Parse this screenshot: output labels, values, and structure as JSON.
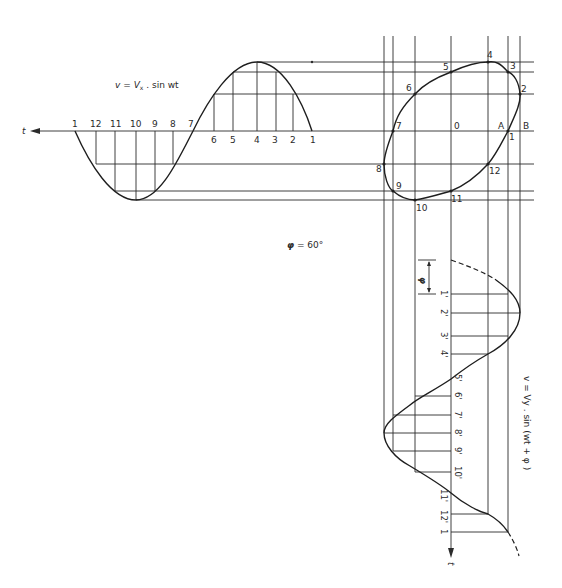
{
  "diagram": {
    "colors": {
      "ink": "#2b2b2b",
      "background": "#ffffff"
    },
    "horizontal_wave": {
      "equation": "v = Vx . sin wt",
      "equation_parts": {
        "v": "v",
        "eq": "=",
        "V": "V",
        "sub": "x",
        "rest": ". sin wt"
      },
      "axis_label": "t",
      "top_labels": [
        "1",
        "12",
        "11",
        "10",
        "9",
        "8",
        "7"
      ],
      "bottom_labels": [
        "6",
        "5",
        "4",
        "3",
        "2",
        "1"
      ]
    },
    "ellipse": {
      "point_labels": [
        "1",
        "2",
        "3",
        "4",
        "5",
        "6",
        "7",
        "8",
        "9",
        "10",
        "11",
        "12"
      ],
      "center_label": "0",
      "label_a": "A",
      "label_b": "B"
    },
    "phase": {
      "label": "φ = 60°",
      "symbol": "φ",
      "value": "= 60°",
      "bracket_label": "φ"
    },
    "vertical_wave": {
      "equation": "v = Vy . sin (wt + φ )",
      "axis_label": "t",
      "labels": [
        "1'",
        "2'",
        "3'",
        "4'",
        "5'",
        "6'",
        "7'",
        "8'",
        "9'",
        "10'",
        "11'",
        "12'",
        "1"
      ]
    }
  }
}
